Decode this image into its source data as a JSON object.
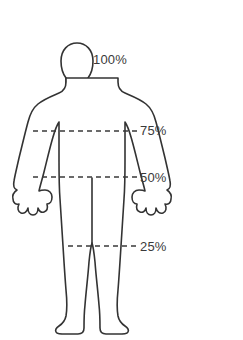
{
  "canvas": {
    "width": 243,
    "height": 340,
    "background": "#ffffff"
  },
  "diagram": {
    "type": "annotated-body-outline",
    "outline_color": "#333333",
    "outline_fill": "none",
    "dash_color": "#3a3a3a",
    "label_color": "#3a3a3a"
  },
  "inset": {
    "name": "circular-cartoon-vignette",
    "shape": "circle",
    "shading": "halftone-dots",
    "ink_color": "#1a1a1a",
    "tone_color": "#9a9a9a",
    "clipped_edge": "top"
  },
  "markers": [
    {
      "id": "marker-100",
      "label": "100%",
      "value": 100,
      "y": 60,
      "has_dashed_line": false,
      "line_x_start": null,
      "line_x_end": null,
      "anatomy": "top-of-head"
    },
    {
      "id": "marker-75",
      "label": "75%",
      "value": 75,
      "y": 131,
      "has_dashed_line": true,
      "line_x_start": 33,
      "line_x_end": 137,
      "anatomy": "armpit-chest"
    },
    {
      "id": "marker-50",
      "label": "50%",
      "value": 50,
      "y": 177,
      "has_dashed_line": true,
      "line_x_start": 33,
      "line_x_end": 137,
      "anatomy": "hip-crotch"
    },
    {
      "id": "marker-25",
      "label": "25%",
      "value": 25,
      "y": 246,
      "has_dashed_line": true,
      "line_x_start": 68,
      "line_x_end": 137,
      "anatomy": "knee"
    }
  ]
}
